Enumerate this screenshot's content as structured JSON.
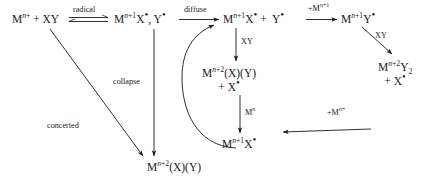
{
  "diagram": {
    "type": "reaction-mechanism-scheme",
    "title": "",
    "species": [
      {
        "id": "reactants",
        "html": "M<span class=\"sup\"><span class=\"ital\">n</span>+</span> + XY",
        "text": "M(n+) + XY",
        "x": 12,
        "y": 12
      },
      {
        "id": "radical-pair",
        "html": "M<span class=\"sup\"><span class=\"ital\">n</span>+1</span>X<span class=\"dot\">&bull;</span>, Y<span class=\"dot\">&bull;</span>",
        "text": "M(n+1)X•, Y•",
        "x": 114,
        "y": 12
      },
      {
        "id": "free-radicals",
        "html": "M<span class=\"sup\"><span class=\"ital\">n</span>+1</span>X<span class=\"dot\">&bull;</span> +&nbsp; Y<span class=\"dot\">&bull;</span>",
        "text": "M(n+1)X• + Y•",
        "x": 223,
        "y": 12
      },
      {
        "id": "metal-y-radical",
        "html": "M<span class=\"sup\"><span class=\"ital\">n</span>+1</span>Y<span class=\"dot\">&bull;</span>",
        "text": "M(n+1)Y•",
        "x": 341,
        "y": 12
      },
      {
        "id": "metal-y2-plus-x-radical",
        "html": "M<span class=\"sup\"><span class=\"ital\">n</span>+2</span>Y<span class=\"sub\">2</span><br>+ X<span class=\"dot\">&bull;</span>",
        "text": "M(n+2)Y2 + X•",
        "x": 378,
        "y": 60
      },
      {
        "id": "metal-xy-plus-x-radical",
        "html": "M<span class=\"sup\"><span class=\"ital\">n</span>+2</span>(X)(Y)<br>+ X<span class=\"dot\">&bull;</span>",
        "text": "M(n+2)(X)(Y) + X•",
        "x": 214,
        "y": 66
      },
      {
        "id": "metal-x-radical-bottom",
        "html": "M<span class=\"sup\"><span class=\"ital\">n</span>+1</span>X<span class=\"dot\">&bull;</span>",
        "text": "M(n+1)X•",
        "x": 238,
        "y": 137
      },
      {
        "id": "product",
        "html": "M<span class=\"sup\"><span class=\"ital\">n</span>+2</span>(X)(Y)",
        "text": "M(n+2)(X)(Y)",
        "x": 147,
        "y": 160
      }
    ],
    "arrow_labels": [
      {
        "id": "radical-label",
        "html": "radical",
        "text": "radical",
        "x": 73,
        "y": 7
      },
      {
        "id": "diffuse-label",
        "html": "diffuse",
        "text": "diffuse",
        "x": 184,
        "y": 7
      },
      {
        "id": "add-metal-n1-label",
        "html": "+M<span class=\"sup\"><span class=\"ital\">n</span>+1</span>",
        "text": "+M(n+1)",
        "x": 309,
        "y": 6
      },
      {
        "id": "xy-right-label",
        "html": "XY",
        "text": "XY",
        "x": 374,
        "y": 30
      },
      {
        "id": "xy-center-label",
        "html": "XY",
        "text": "XY",
        "x": 240,
        "y": 40
      },
      {
        "id": "collapse-label",
        "html": "collapse",
        "text": "collapse",
        "x": 113,
        "y": 77
      },
      {
        "id": "metal-n-label",
        "html": "M<span class=\"sup\"><span class=\"ital\">n</span></span>",
        "text": "M(n)",
        "x": 245,
        "y": 110
      },
      {
        "id": "add-metal-n-label",
        "html": "+M<span class=\"sup\"><span class=\"ital\">n</span>+</span>",
        "text": "+M(n+)",
        "x": 328,
        "y": 110
      },
      {
        "id": "concerted-label",
        "html": "concerted",
        "text": "concerted",
        "x": 47,
        "y": 121
      }
    ],
    "arrows": [
      {
        "id": "equilibrium-arrow",
        "kind": "equilibrium",
        "from": "reactants",
        "to": "radical-pair"
      },
      {
        "id": "diffuse-arrow",
        "kind": "straight",
        "from": "radical-pair",
        "to": "free-radicals"
      },
      {
        "id": "add-metal-arrow",
        "kind": "straight",
        "from": "free-radicals",
        "to": "metal-y-radical"
      },
      {
        "id": "xy-right-arrow",
        "kind": "diagonal",
        "from": "metal-y-radical",
        "to": "metal-y2-plus-x-radical"
      },
      {
        "id": "xy-center-arrow",
        "kind": "vertical",
        "from": "free-radicals",
        "to": "metal-xy-plus-x-radical"
      },
      {
        "id": "collapse-arrow",
        "kind": "vertical",
        "from": "radical-pair",
        "to": "product"
      },
      {
        "id": "metal-n-arrow",
        "kind": "vertical",
        "from": "metal-xy-plus-x-radical",
        "to": "metal-x-radical-bottom"
      },
      {
        "id": "add-metal-n-arrow",
        "kind": "diagonal",
        "from": "metal-y2-plus-x-radical",
        "to": "metal-x-radical-bottom"
      },
      {
        "id": "recycle-curved-arrow",
        "kind": "curved",
        "from": "metal-x-radical-bottom",
        "to": "diffuse-arrow"
      },
      {
        "id": "concerted-arrow",
        "kind": "diagonal",
        "from": "reactants",
        "to": "product"
      }
    ]
  }
}
